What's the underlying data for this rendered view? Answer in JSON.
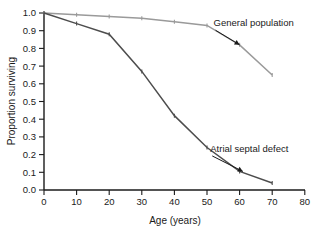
{
  "chart_data": {
    "type": "line",
    "title": "",
    "xlabel": "Age (years)",
    "ylabel": "Proportion surviving",
    "xlim": [
      0,
      80
    ],
    "ylim": [
      0.0,
      1.0
    ],
    "xticks": [
      0,
      10,
      20,
      30,
      40,
      50,
      60,
      70,
      80
    ],
    "xticklabels": [
      "0",
      "10",
      "20",
      "30",
      "40",
      "50",
      "60",
      "70",
      "80"
    ],
    "yticks": [
      0.0,
      0.1,
      0.2,
      0.3,
      0.4,
      0.5,
      0.6,
      0.7,
      0.8,
      0.9,
      1.0
    ],
    "yticklabels": [
      "0.0",
      "0.1",
      "0.2",
      "0.3",
      "0.4",
      "0.5",
      "0.6",
      "0.7",
      "0.8",
      "0.9",
      "1.0"
    ],
    "grid": false,
    "legend": "none (inline annotations with arrows)",
    "x": [
      0,
      10,
      20,
      30,
      40,
      50,
      60,
      70
    ],
    "series": [
      {
        "name": "General population",
        "color": "#9a9a9a",
        "marker": "tick",
        "values": [
          1.0,
          0.99,
          0.98,
          0.97,
          0.95,
          0.93,
          0.82,
          0.65
        ]
      },
      {
        "name": "Atrial septal defect",
        "color": "#4d4d4d",
        "marker": "tick",
        "values": [
          1.0,
          0.94,
          0.88,
          0.67,
          0.42,
          0.24,
          0.105,
          0.04
        ]
      }
    ],
    "annotations": [
      {
        "text": "General population",
        "label_x": 52,
        "label_y": 0.925,
        "point_x": 60,
        "point_y": 0.82
      },
      {
        "text": "Atrial septal defect",
        "label_x": 51,
        "label_y": 0.215,
        "point_x": 61,
        "point_y": 0.105
      }
    ]
  },
  "axes": {
    "x_title": "Age (years)",
    "y_title": "Proportion surviving"
  }
}
